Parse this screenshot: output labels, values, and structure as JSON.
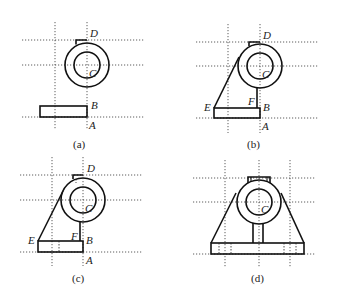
{
  "figure": {
    "panels": [
      {
        "id": "a",
        "caption": "(a)",
        "points": {
          "D": "D",
          "C": "C",
          "B": "B",
          "A": "A"
        }
      },
      {
        "id": "b",
        "caption": "(b)",
        "points": {
          "D": "D",
          "C": "C",
          "B": "B",
          "A": "A",
          "E": "E",
          "F": "F"
        }
      },
      {
        "id": "c",
        "caption": "(c)",
        "points": {
          "D": "D",
          "C": "C",
          "B": "B",
          "A": "A",
          "E": "E",
          "F": "F"
        }
      },
      {
        "id": "d",
        "caption": "(d)",
        "points": {
          "C": "C"
        }
      }
    ]
  },
  "colors": {
    "line": "#111111",
    "background": "#ffffff"
  }
}
